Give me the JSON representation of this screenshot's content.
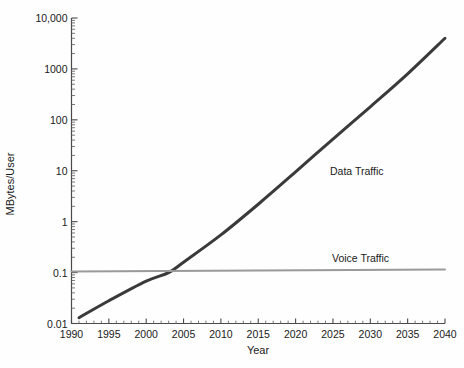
{
  "chart_data": {
    "type": "line",
    "title": "",
    "xlabel": "Year",
    "ylabel": "MBytes/User",
    "xlim": [
      1990,
      2040
    ],
    "ylim": [
      0.01,
      10000
    ],
    "yscale": "log",
    "xscale": "linear",
    "grid": false,
    "legend": "inline-annotations",
    "x_ticks": [
      "1990",
      "1995",
      "2000",
      "2005",
      "2010",
      "2015",
      "2020",
      "2025",
      "2030",
      "2035",
      "2040"
    ],
    "x_tick_values": [
      1990,
      1995,
      2000,
      2005,
      2010,
      2015,
      2020,
      2025,
      2030,
      2035,
      2040
    ],
    "x_minor_tick_step": 1,
    "y_ticks": [
      "10,000",
      "1000",
      "100",
      "10",
      "1",
      "0.1",
      "0.01"
    ],
    "y_tick_values": [
      10000,
      1000,
      100,
      10,
      1,
      0.1,
      0.01
    ],
    "series": [
      {
        "name": "Data Traffic",
        "color": "#3a3a3a",
        "width": 3.0,
        "x": [
          1991,
          1995,
          2000,
          2003,
          2005,
          2010,
          2015,
          2020,
          2025,
          2030,
          2035,
          2040
        ],
        "values": [
          0.013,
          0.028,
          0.068,
          0.1,
          0.16,
          0.55,
          2.2,
          9.5,
          42,
          180,
          800,
          4000
        ]
      },
      {
        "name": "Voice Traffic",
        "color": "#9a9a9a",
        "width": 2.0,
        "x": [
          1990,
          2040
        ],
        "values": [
          0.105,
          0.115
        ]
      }
    ],
    "annotations": [
      {
        "text": "Data Traffic",
        "x": 2022,
        "y": 30
      },
      {
        "text": "Voice Traffic",
        "x": 2023,
        "y": 0.18
      }
    ],
    "crossover_year": 2003
  },
  "axes": {
    "x_title": "Year",
    "y_title": "MBytes/User"
  }
}
